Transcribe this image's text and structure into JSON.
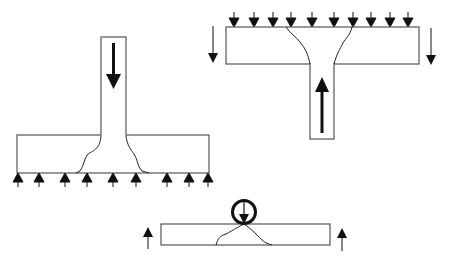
{
  "diagram": {
    "colors": {
      "line": "#555555",
      "arrow": "#111111",
      "crack": "#222222",
      "background": "#ffffff"
    },
    "panels": [
      {
        "id": "column-load-on-slab",
        "column": {
          "x": 101,
          "y": 37,
          "w": 25,
          "h": 98,
          "arrow": "down"
        },
        "slab": {
          "x": 17,
          "y": 135,
          "w": 192,
          "h": 38
        },
        "support_arrows": {
          "direction": "up",
          "xs": [
            18,
            39,
            65,
            87,
            113,
            136,
            167,
            189,
            208
          ],
          "y_top": 173,
          "y_bottom": 186
        }
      },
      {
        "id": "distributed-load-slab-column-below",
        "slab": {
          "x": 226,
          "y": 27,
          "w": 193,
          "h": 37
        },
        "column": {
          "x": 310,
          "y": 64,
          "w": 24,
          "h": 75,
          "arrow": "up"
        },
        "load_arrows": {
          "direction": "down",
          "xs": [
            234,
            254,
            273,
            291,
            312,
            334,
            353,
            371,
            390,
            408
          ],
          "y_top": 13,
          "y_bottom": 27
        },
        "side_arrows": {
          "direction": "down",
          "xs": [
            213,
            431
          ]
        }
      },
      {
        "id": "point-load-beam",
        "slab": {
          "x": 161,
          "y": 224,
          "w": 169,
          "h": 21
        },
        "point_load": {
          "cx": 244,
          "cy": 212,
          "r": 12,
          "arrow": "down"
        },
        "side_arrows": {
          "direction": "up",
          "xs": [
            148,
            342
          ]
        }
      }
    ]
  }
}
